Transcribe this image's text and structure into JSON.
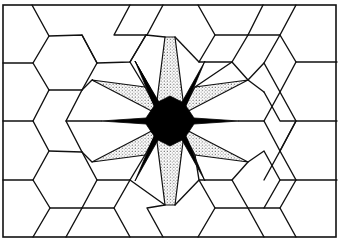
{
  "figure": {
    "title": "",
    "colors": {
      "background": "#ffffff",
      "line": "#111111",
      "star_fill": "#000000",
      "stipple": "#333333"
    },
    "frame": {
      "x1": 3,
      "y1": 5,
      "x2": 336,
      "y2": 237
    },
    "center": {
      "x": 170,
      "y": 121
    },
    "star_points": [
      [
        170,
        121
      ],
      [
        135,
        60
      ],
      [
        156,
        108
      ],
      [
        98,
        121
      ]
    ]
  }
}
